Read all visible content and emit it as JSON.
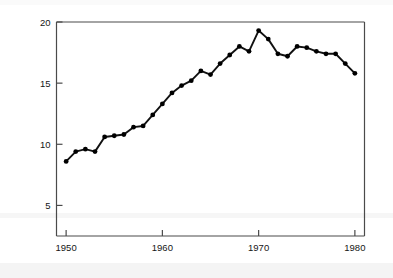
{
  "chart_data": {
    "type": "line",
    "title": "",
    "xlabel": "",
    "ylabel": "Fish catch (kg per capita)",
    "x": [
      1950,
      1951,
      1952,
      1953,
      1954,
      1955,
      1956,
      1957,
      1958,
      1959,
      1960,
      1961,
      1962,
      1963,
      1964,
      1965,
      1966,
      1967,
      1968,
      1969,
      1970,
      1971,
      1972,
      1973,
      1974,
      1975,
      1976,
      1977,
      1978,
      1979,
      1980
    ],
    "values": [
      8.6,
      9.4,
      9.6,
      9.4,
      10.6,
      10.7,
      10.8,
      11.4,
      11.5,
      12.4,
      13.3,
      14.2,
      14.8,
      15.2,
      16.0,
      15.7,
      16.6,
      17.3,
      18.0,
      17.6,
      19.3,
      18.6,
      17.4,
      17.2,
      18.0,
      17.9,
      17.6,
      17.4,
      17.4,
      16.6,
      15.8
    ],
    "xlim": [
      1949,
      1981
    ],
    "ylim": [
      2.5,
      20
    ],
    "xticks": [
      1950,
      1960,
      1970,
      1980
    ],
    "xtick_labels": [
      "1950",
      "1960",
      "1970",
      "1980"
    ],
    "yticks": [
      5,
      10,
      15,
      20
    ],
    "ytick_labels": [
      "5",
      "10",
      "15",
      "20"
    ],
    "grid": false,
    "legend": null,
    "series_name": "Fish catch",
    "line_color": "#111111",
    "marker": "circle",
    "marker_color": "#000000"
  },
  "figure": {
    "background_color": "#ffffff",
    "axis_color": "#4a4a4a"
  }
}
